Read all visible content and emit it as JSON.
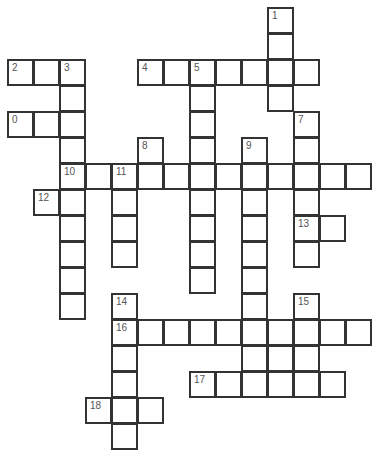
{
  "puzzle": {
    "cell_size": 26,
    "origin_x": 8,
    "origin_y": 8,
    "border_color": "#333333",
    "number_color": "#555555",
    "cells": [
      {
        "r": 0,
        "c": 10,
        "n": "1"
      },
      {
        "r": 1,
        "c": 10
      },
      {
        "r": 2,
        "c": 0,
        "n": "2"
      },
      {
        "r": 2,
        "c": 1
      },
      {
        "r": 2,
        "c": 2,
        "n": "3"
      },
      {
        "r": 2,
        "c": 5,
        "n": "4"
      },
      {
        "r": 2,
        "c": 6
      },
      {
        "r": 2,
        "c": 7,
        "n": "5"
      },
      {
        "r": 2,
        "c": 8
      },
      {
        "r": 2,
        "c": 9
      },
      {
        "r": 2,
        "c": 10
      },
      {
        "r": 2,
        "c": 11
      },
      {
        "r": 3,
        "c": 2
      },
      {
        "r": 3,
        "c": 7
      },
      {
        "r": 3,
        "c": 10
      },
      {
        "r": 4,
        "c": 0,
        "n": "0"
      },
      {
        "r": 4,
        "c": 1
      },
      {
        "r": 4,
        "c": 2
      },
      {
        "r": 4,
        "c": 7
      },
      {
        "r": 4,
        "c": 11,
        "n": "7"
      },
      {
        "r": 5,
        "c": 2
      },
      {
        "r": 5,
        "c": 5,
        "n": "8"
      },
      {
        "r": 5,
        "c": 7
      },
      {
        "r": 5,
        "c": 9,
        "n": "9"
      },
      {
        "r": 5,
        "c": 11
      },
      {
        "r": 6,
        "c": 2,
        "n": "10"
      },
      {
        "r": 6,
        "c": 3
      },
      {
        "r": 6,
        "c": 4,
        "n": "11"
      },
      {
        "r": 6,
        "c": 5
      },
      {
        "r": 6,
        "c": 6
      },
      {
        "r": 6,
        "c": 7
      },
      {
        "r": 6,
        "c": 8
      },
      {
        "r": 6,
        "c": 9
      },
      {
        "r": 6,
        "c": 10
      },
      {
        "r": 6,
        "c": 11
      },
      {
        "r": 6,
        "c": 12
      },
      {
        "r": 6,
        "c": 13
      },
      {
        "r": 7,
        "c": 1,
        "n": "12"
      },
      {
        "r": 7,
        "c": 2
      },
      {
        "r": 7,
        "c": 4
      },
      {
        "r": 7,
        "c": 7
      },
      {
        "r": 7,
        "c": 9
      },
      {
        "r": 7,
        "c": 11
      },
      {
        "r": 8,
        "c": 2
      },
      {
        "r": 8,
        "c": 4
      },
      {
        "r": 8,
        "c": 7
      },
      {
        "r": 8,
        "c": 9
      },
      {
        "r": 8,
        "c": 11,
        "n": "13"
      },
      {
        "r": 8,
        "c": 12
      },
      {
        "r": 9,
        "c": 2
      },
      {
        "r": 9,
        "c": 4
      },
      {
        "r": 9,
        "c": 7
      },
      {
        "r": 9,
        "c": 9
      },
      {
        "r": 9,
        "c": 11
      },
      {
        "r": 10,
        "c": 2
      },
      {
        "r": 10,
        "c": 7
      },
      {
        "r": 10,
        "c": 9
      },
      {
        "r": 11,
        "c": 2
      },
      {
        "r": 11,
        "c": 4,
        "n": "14"
      },
      {
        "r": 11,
        "c": 9
      },
      {
        "r": 11,
        "c": 11,
        "n": "15"
      },
      {
        "r": 12,
        "c": 4,
        "n": "16"
      },
      {
        "r": 12,
        "c": 5
      },
      {
        "r": 12,
        "c": 6
      },
      {
        "r": 12,
        "c": 7
      },
      {
        "r": 12,
        "c": 8
      },
      {
        "r": 12,
        "c": 9
      },
      {
        "r": 12,
        "c": 10
      },
      {
        "r": 12,
        "c": 11
      },
      {
        "r": 12,
        "c": 12
      },
      {
        "r": 12,
        "c": 13
      },
      {
        "r": 13,
        "c": 4
      },
      {
        "r": 13,
        "c": 9
      },
      {
        "r": 13,
        "c": 10
      },
      {
        "r": 13,
        "c": 11
      },
      {
        "r": 14,
        "c": 4
      },
      {
        "r": 14,
        "c": 7,
        "n": "17"
      },
      {
        "r": 14,
        "c": 8
      },
      {
        "r": 14,
        "c": 9
      },
      {
        "r": 14,
        "c": 10
      },
      {
        "r": 14,
        "c": 11
      },
      {
        "r": 14,
        "c": 12
      },
      {
        "r": 15,
        "c": 3,
        "n": "18"
      },
      {
        "r": 15,
        "c": 4
      },
      {
        "r": 15,
        "c": 5
      },
      {
        "r": 16,
        "c": 4
      }
    ],
    "clue_numbers": [
      "1",
      "2",
      "3",
      "4",
      "5",
      "0",
      "7",
      "8",
      "9",
      "10",
      "11",
      "12",
      "13",
      "14",
      "15",
      "16",
      "17",
      "18"
    ]
  }
}
